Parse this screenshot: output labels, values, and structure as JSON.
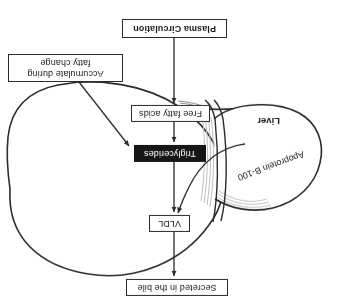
{
  "figure": {
    "orientation": "rotated-180",
    "background_color": "#ffffff",
    "line_color": "#2b2b2b",
    "shade_color": "#b9b9b9"
  },
  "organ": {
    "name": "Liver",
    "label": "Liver",
    "fill_color": "#ffffff",
    "outline_color": "#2b2b2b"
  },
  "boxes": {
    "secreted_bile": {
      "label": "Secreted in the bile",
      "style": "outlined",
      "x": 113,
      "y": 11,
      "width": 102,
      "height": 17
    },
    "vldl": {
      "label": "VLDL",
      "style": "outlined",
      "x": 151,
      "y": 75,
      "width": 41,
      "height": 17
    },
    "triglycerides": {
      "label": "Triglycerides",
      "style": "inverted",
      "x": 135,
      "y": 145,
      "width": 72,
      "height": 18
    },
    "free_fatty_acids": {
      "label": "Free fatty acids",
      "style": "outlined",
      "x": 131,
      "y": 185,
      "width": 79,
      "height": 17
    },
    "plasma_circulation": {
      "label": "Plasma Circulation",
      "style": "outlined-bold",
      "x": 114,
      "y": 269,
      "width": 105,
      "height": 20
    },
    "fatty_change": {
      "label": "Accumulate during fatty change",
      "line1": "Accumulate during",
      "line2": "fatty change",
      "style": "outlined",
      "x": 218,
      "y": 225,
      "width": 115,
      "height": 30
    }
  },
  "plain_labels": {
    "apoprotein": "Apoprotein B-100",
    "liver": "Liver"
  },
  "arrows": [
    {
      "name": "plasma-to-free-fatty-acids",
      "from": "Plasma Circulation",
      "to": "Free fatty acids",
      "direction": "up"
    },
    {
      "name": "free-fatty-acids-to-triglycerides",
      "from": "Free fatty acids",
      "to": "Triglycerides",
      "direction": "up"
    },
    {
      "name": "triglycerides-to-vldl",
      "from": "Triglycerides",
      "to": "VLDL",
      "direction": "up"
    },
    {
      "name": "vldl-to-secreted-bile",
      "from": "VLDL",
      "to": "Secreted in the bile",
      "direction": "up"
    },
    {
      "name": "apoprotein-to-vldl",
      "from": "Apoprotein B-100",
      "to": "VLDL",
      "direction": "curved"
    },
    {
      "name": "fatty-change-to-triglycerides",
      "from": "Accumulate during fatty change",
      "to": "Triglycerides",
      "direction": "diagonal"
    }
  ]
}
